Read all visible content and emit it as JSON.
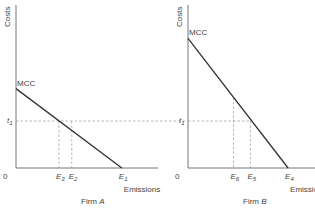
{
  "chart_data": [
    {
      "type": "line",
      "title": "Firm A",
      "ylabel": "Costs",
      "xlabel": "Emissions",
      "origin_label": "0",
      "curve_label": "MCC",
      "tax_label": "t",
      "tax_subscript": "1",
      "xlim": [
        0,
        10
      ],
      "ylim": [
        0,
        10
      ],
      "mcc": {
        "intercept_cost": 4.9,
        "intercept_emissions": 7.4
      },
      "tax_level": 2.9,
      "x_markers": [
        {
          "label": "E",
          "sub": "3",
          "value": 3.0,
          "dashed_to": "tax"
        },
        {
          "label": "E",
          "sub": "2",
          "value": 3.9,
          "dashed_to": "tax"
        },
        {
          "label": "E",
          "sub": "1",
          "value": 7.4,
          "dashed_to": "none"
        }
      ]
    },
    {
      "type": "line",
      "title": "Firm B",
      "ylabel": "Costs",
      "xlabel": "Emissions",
      "origin_label": "0",
      "curve_label": "MCC",
      "tax_label": "t",
      "tax_subscript": "1",
      "xlim": [
        0,
        10
      ],
      "ylim": [
        0,
        10
      ],
      "mcc": {
        "intercept_cost": 8.0,
        "intercept_emissions": 7.7
      },
      "tax_level": 2.9,
      "x_markers": [
        {
          "label": "E",
          "sub": "6",
          "value": 3.5,
          "dashed_to": "curve"
        },
        {
          "label": "E",
          "sub": "5",
          "value": 4.8,
          "dashed_to": "tax"
        },
        {
          "label": "E",
          "sub": "4",
          "value": 7.7,
          "dashed_to": "none"
        }
      ]
    }
  ]
}
